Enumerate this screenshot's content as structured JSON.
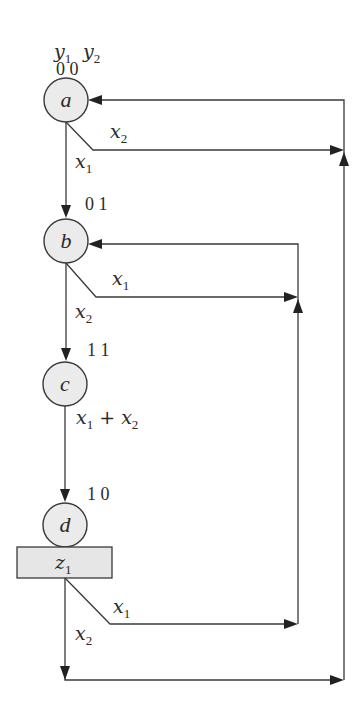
{
  "diagram": {
    "type": "ASM state diagram",
    "header": {
      "var1": "y",
      "var1_sub": "1",
      "var2": "y",
      "var2_sub": "2"
    },
    "states": [
      {
        "id": "a",
        "label": "a",
        "code": "0 0"
      },
      {
        "id": "b",
        "label": "b",
        "code": "0 1"
      },
      {
        "id": "c",
        "label": "c",
        "code": "1 1"
      },
      {
        "id": "d",
        "label": "d",
        "code": "1 0"
      }
    ],
    "output_box": {
      "var": "z",
      "sub": "1"
    },
    "transitions": [
      {
        "from": "a",
        "to": "b",
        "cond_var": "x",
        "cond_sub": "1"
      },
      {
        "from": "a",
        "to": "a",
        "cond_var": "x",
        "cond_sub": "2"
      },
      {
        "from": "b",
        "to": "c",
        "cond_var": "x",
        "cond_sub": "2"
      },
      {
        "from": "b",
        "to": "b",
        "cond_var": "x",
        "cond_sub": "1"
      },
      {
        "from": "c",
        "to": "d",
        "cond_a_var": "x",
        "cond_a_sub": "1",
        "op": "+",
        "cond_b_var": "x",
        "cond_b_sub": "2"
      },
      {
        "from": "d",
        "to": "b",
        "cond_var": "x",
        "cond_sub": "1"
      },
      {
        "from": "d",
        "to": "a",
        "cond_var": "x",
        "cond_sub": "2"
      }
    ]
  }
}
